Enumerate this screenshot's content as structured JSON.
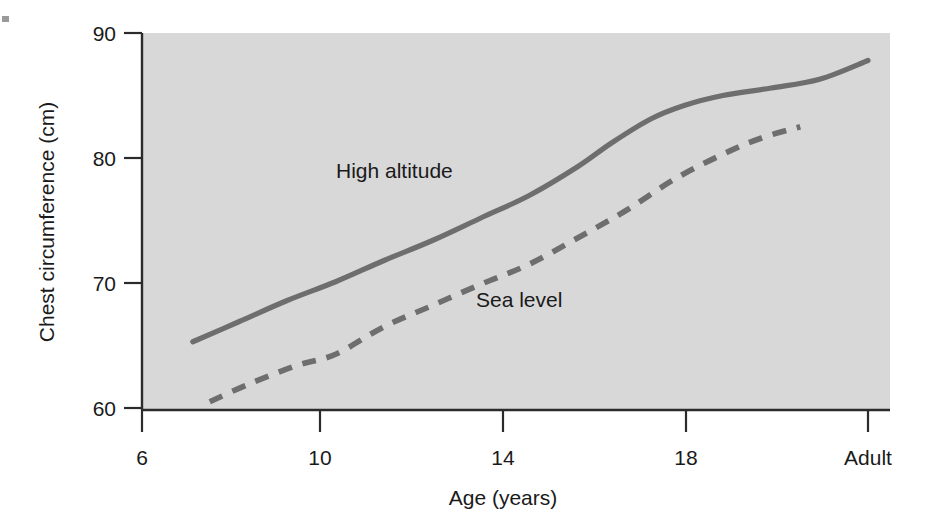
{
  "chart_data": {
    "type": "line",
    "title": "",
    "subtitle": "",
    "xlabel": "Age (years)",
    "ylabel": "Chest circumference (cm)",
    "xlim": [
      6,
      21
    ],
    "ylim": [
      60,
      90
    ],
    "grid": false,
    "legend_position": "inline-annotations",
    "background": "#d8d8d8",
    "line_color": "#6e6e6e",
    "x_tick_labels": [
      "6",
      "10",
      "14",
      "18",
      "Adult"
    ],
    "x_tick_values": [
      6,
      10,
      14,
      18,
      21
    ],
    "y_tick_labels": [
      "60",
      "70",
      "80",
      "90"
    ],
    "y_tick_values": [
      60,
      70,
      80,
      90
    ],
    "series": [
      {
        "name": "High altitude",
        "style": "solid",
        "label_text": "High altitude",
        "x": [
          7.05,
          8,
          9,
          10,
          11,
          12,
          13,
          14,
          15,
          15.7,
          16.5,
          17.2,
          18,
          19,
          20,
          21
        ],
        "values": [
          65.3,
          66.9,
          68.6,
          70.1,
          71.8,
          73.4,
          75.2,
          77.0,
          79.3,
          81.2,
          83.1,
          84.2,
          85.0,
          85.6,
          86.3,
          87.8
        ]
      },
      {
        "name": "Sea level",
        "style": "dashed",
        "label_text": "Sea level",
        "x": [
          7.4,
          8.2,
          9.2,
          10,
          11,
          12,
          13,
          14,
          15,
          16,
          17,
          18,
          18.8,
          19.6
        ],
        "values": [
          60.5,
          61.9,
          63.4,
          64.3,
          66.5,
          68.2,
          69.9,
          71.5,
          73.6,
          75.8,
          78.3,
          80.3,
          81.6,
          82.5
        ]
      }
    ],
    "annotations": [
      {
        "text": "High altitude",
        "x_px": 336,
        "y_px": 178
      },
      {
        "text": "Sea level",
        "x_px": 476,
        "y_px": 307
      }
    ]
  },
  "axes": {
    "y_title": "Chest circumference (cm)",
    "x_title": "Age (years)",
    "y_ticks": [
      {
        "label": "90",
        "y_px": 33
      },
      {
        "label": "80",
        "y_px": 158
      },
      {
        "label": "70",
        "y_px": 283
      },
      {
        "label": "60",
        "y_px": 408
      }
    ],
    "x_ticks": [
      {
        "label": "6",
        "x_px": 142
      },
      {
        "label": "10",
        "x_px": 320
      },
      {
        "label": "14",
        "x_px": 503
      },
      {
        "label": "18",
        "x_px": 686
      },
      {
        "label": "Adult",
        "x_px": 868
      }
    ]
  }
}
